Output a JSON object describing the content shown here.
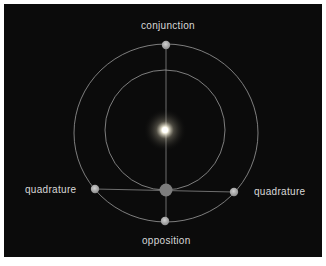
{
  "diagram": {
    "labels": {
      "top": "conjunction",
      "bottom": "opposition",
      "left": "quadrature",
      "right": "quadrature"
    },
    "colors": {
      "background": "#0b0b0b",
      "orbit": "#9a9a9a",
      "planet": "#a8a8a8",
      "earth": "#7a7a7a",
      "sun": "#ffffff",
      "text": "#d8d8d8"
    },
    "elements": {
      "sun": {
        "x": 165,
        "y": 130
      },
      "inner_orbit": {
        "cx": 165,
        "cy": 130,
        "r": 60
      },
      "outer_orbit": {
        "cx": 166,
        "cy": 133,
        "rx": 92,
        "ry": 89
      },
      "earth": {
        "x": 166,
        "y": 190,
        "r": 6.5
      },
      "planets": [
        {
          "name": "conjunction",
          "x": 166,
          "y": 45
        },
        {
          "name": "opposition",
          "x": 165,
          "y": 221
        },
        {
          "name": "quadrature-left",
          "x": 95,
          "y": 189
        },
        {
          "name": "quadrature-right",
          "x": 234,
          "y": 192
        }
      ]
    }
  }
}
